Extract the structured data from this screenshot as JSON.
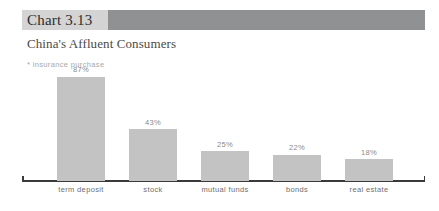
{
  "header": {
    "chart_number": "Chart 3.13",
    "title": "China's Affluent Consumers",
    "note": "* insurance purchase"
  },
  "colors": {
    "band_light": "#d4d4d4",
    "band_dark": "#8f9193",
    "bar_fill": "#c3c3c3",
    "axis": "#3a3a3a",
    "value_text": "#8a8a8a",
    "category_text": "#6f6f6f",
    "note_text": "#a8a8a8"
  },
  "chart_data": {
    "type": "bar",
    "title": "China's Affluent Consumers",
    "subtitle": "Chart 3.13",
    "annotations": [
      "* insurance purchase"
    ],
    "categories": [
      "term deposit",
      "stock",
      "mutual funds",
      "bonds",
      "real estate"
    ],
    "values": [
      87,
      43,
      25,
      22,
      18
    ],
    "value_labels": [
      "87%",
      "43%",
      "25%",
      "22%",
      "18%"
    ],
    "xlabel": "",
    "ylabel": "",
    "ylim": [
      0,
      100
    ],
    "grid": false,
    "legend": "none",
    "units": "percent"
  }
}
